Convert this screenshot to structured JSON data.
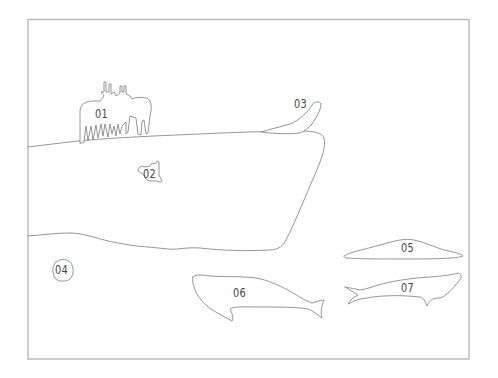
{
  "diagram": {
    "frame_color": "#b8b8b8",
    "line_color": "#8a8a8a",
    "regions": [
      {
        "id": "01",
        "label": "01",
        "subject": "land animals (cattle/deer group)"
      },
      {
        "id": "02",
        "label": "02",
        "subject": "small creature on ice"
      },
      {
        "id": "03",
        "label": "03",
        "subject": "seal on ice edge"
      },
      {
        "id": "04",
        "label": "04",
        "subject": "small object in water"
      },
      {
        "id": "05",
        "label": "05",
        "subject": "flat floating shape"
      },
      {
        "id": "06",
        "label": "06",
        "subject": "large whale"
      },
      {
        "id": "07",
        "label": "07",
        "subject": "whale"
      }
    ]
  }
}
